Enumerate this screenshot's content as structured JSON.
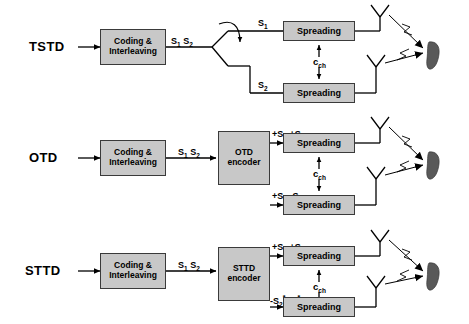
{
  "diagram": {
    "colors": {
      "block_fill": "#c8c8c8",
      "block_stroke": "#3a3a3a",
      "line": "#000000",
      "handset": "#595959"
    },
    "common": {
      "coding_block_line1": "Coding &",
      "coding_block_line2": "Interleaving",
      "spreading_label": "Spreading",
      "cch_label": "c",
      "cch_sub": "ch",
      "antenna_icon": "antenna-icon",
      "handset_icon": "mobile-handset-icon",
      "input_arrow_icon": "input-arrow-icon"
    },
    "rows": [
      {
        "id": "tstd",
        "label": "TSTD",
        "encoder": null,
        "switch_icon": "toggle-switch-icon",
        "branch_top_label": "S",
        "branch_top_sub": "1",
        "branch_bottom_label": "S",
        "branch_bottom_sub": "2",
        "interleaver_out": "S",
        "interleaver_out_sub1": "1",
        "interleaver_out2": "S",
        "interleaver_out_sub2": "2"
      },
      {
        "id": "otd",
        "label": "OTD",
        "encoder_line1": "OTD",
        "encoder_line2": "encoder",
        "branch_top_label": "+S",
        "branch_top_sub": "1",
        "branch_top_label2": "+S",
        "branch_top_sub2": "1",
        "branch_bottom_label": "+S",
        "branch_bottom_sub": "2",
        "branch_bottom_label2": "-S",
        "branch_bottom_sub2": "2",
        "interleaver_out": "S",
        "interleaver_out_sub1": "1",
        "interleaver_out2": "S",
        "interleaver_out_sub2": "2"
      },
      {
        "id": "sttd",
        "label": "STTD",
        "encoder_line1": "STTD",
        "encoder_line2": "encoder",
        "branch_top_label": "+S",
        "branch_top_sub": "1",
        "branch_top_label2": "+S",
        "branch_top_sub2": "2",
        "branch_bottom_label": "-S",
        "branch_bottom_sub": "2",
        "branch_bottom_sup": "*",
        "branch_bottom_label2": "S",
        "branch_bottom_sub2": "1",
        "branch_bottom_sup2": "*",
        "interleaver_out": "S",
        "interleaver_out_sub1": "1",
        "interleaver_out2": "S",
        "interleaver_out_sub2": "2"
      }
    ]
  }
}
